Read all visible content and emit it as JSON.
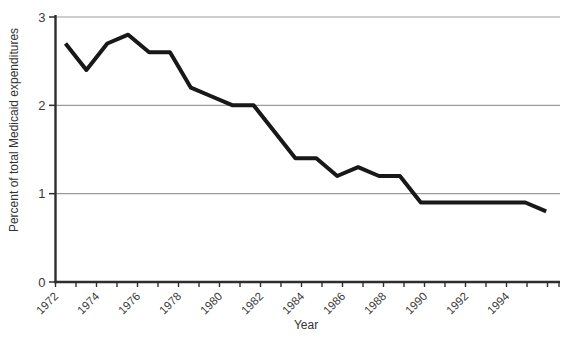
{
  "chart_data": {
    "type": "line",
    "x": [
      1972,
      1973,
      1974,
      1975,
      1976,
      1977,
      1978,
      1979,
      1980,
      1981,
      1982,
      1983,
      1984,
      1985,
      1986,
      1987,
      1988,
      1989,
      1990,
      1991,
      1992,
      1993,
      1994,
      1995
    ],
    "values": [
      2.7,
      2.4,
      2.7,
      2.8,
      2.6,
      2.6,
      2.2,
      2.1,
      2.0,
      2.0,
      1.7,
      1.4,
      1.4,
      1.2,
      1.3,
      1.2,
      1.2,
      0.9,
      0.9,
      0.9,
      0.9,
      0.9,
      0.9,
      0.8
    ],
    "xlabel": "Year",
    "ylabel": "Percent of total Medicaid expenditures",
    "ylim": [
      0,
      3
    ],
    "yticks": [
      0,
      1,
      2,
      3
    ],
    "xticks_all": [
      1972,
      1973,
      1974,
      1975,
      1976,
      1977,
      1978,
      1979,
      1980,
      1981,
      1982,
      1983,
      1984,
      1985,
      1986,
      1987,
      1988,
      1989,
      1990,
      1991,
      1992,
      1993,
      1994,
      1995,
      1996
    ],
    "xticks_labeled": [
      1972,
      1974,
      1976,
      1978,
      1980,
      1982,
      1984,
      1986,
      1988,
      1990,
      1992,
      1994
    ],
    "grid": "horizontal gridlines at y = 1, 2, 3",
    "legend": "none",
    "line_color": "#181818",
    "grid_color": "#9b9b9b",
    "axis_color": "#2e2e2e",
    "text_color": "#3a3a3a"
  }
}
